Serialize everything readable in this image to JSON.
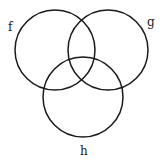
{
  "diagram": {
    "type": "venn",
    "stroke_color": "#1a1a1a",
    "background": "#ffffff",
    "sets": [
      {
        "id": "f",
        "label": "f",
        "cx": 55,
        "cy": 50,
        "r": 40,
        "label_x": 8,
        "label_y": 31
      },
      {
        "id": "g",
        "label": "g",
        "cx": 108,
        "cy": 50,
        "r": 40,
        "label_x": 147,
        "label_y": 26
      },
      {
        "id": "h",
        "label": "h",
        "cx": 83,
        "cy": 97,
        "r": 40,
        "label_x": 80,
        "label_y": 155
      }
    ]
  }
}
